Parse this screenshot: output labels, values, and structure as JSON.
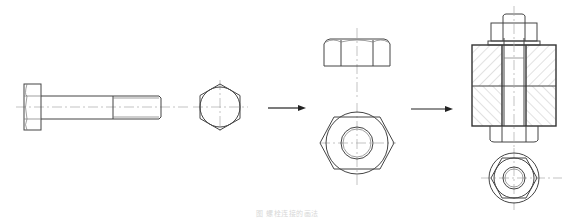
{
  "figure": {
    "caption": "图  螺栓连接的画法",
    "views": [
      {
        "id": "bolt-front",
        "label": "bolt front view"
      },
      {
        "id": "bolt-end",
        "label": "bolt end view (hexagon)"
      },
      {
        "id": "nut-front",
        "label": "nut front view"
      },
      {
        "id": "nut-top",
        "label": "nut top view"
      },
      {
        "id": "assembly-section",
        "label": "bolted joint sectional view"
      },
      {
        "id": "assembly-bottom",
        "label": "bolted joint bottom view"
      }
    ],
    "arrows": [
      {
        "from": "bolt-end",
        "to": "nut"
      },
      {
        "from": "nut",
        "to": "assembly"
      }
    ],
    "colors": {
      "line": "#444444",
      "centerline": "#aaaaaa",
      "hatch": "#999999",
      "background": "#ffffff"
    }
  }
}
